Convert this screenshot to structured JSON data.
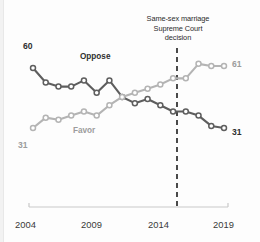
{
  "chart_data": {
    "type": "line",
    "title": "",
    "subtitle": "",
    "xlabel": "",
    "ylabel": "",
    "xlim": [
      2004,
      2019
    ],
    "ylim": [
      0,
      100
    ],
    "grid": false,
    "legend_position": "inline-labels",
    "x": [
      2004,
      2005,
      2006,
      2007,
      2008,
      2009,
      2010,
      2011,
      2012,
      2013,
      2014,
      2015,
      2016,
      2017,
      2018,
      2019
    ],
    "tick_labels": [
      "2004",
      "2009",
      "2014",
      "2019"
    ],
    "tick_values": [
      2004,
      2009,
      2014,
      2019
    ],
    "series": [
      {
        "name": "Oppose",
        "color": "#5e5e5e",
        "values": [
          60,
          53,
          51,
          51,
          54,
          48,
          54,
          46,
          43,
          45,
          42,
          39,
          39,
          37,
          32,
          31
        ],
        "start_label": "60",
        "end_label": "31"
      },
      {
        "name": "Favor",
        "color": "#b4b4b4",
        "values": [
          31,
          36,
          35,
          37,
          39,
          37,
          42,
          46,
          48,
          50,
          52,
          55,
          55,
          62,
          61,
          61
        ],
        "start_label": "31",
        "end_label": "61"
      }
    ],
    "annotations": [
      {
        "name": "supreme-court-decision",
        "lines": [
          "Same-sex marriage",
          "Supreme Court",
          "decision"
        ],
        "x": 2015.3,
        "style": "dashed-vertical-line",
        "color": "#2b2b2b"
      }
    ]
  },
  "annotation": {
    "line1": "Same-sex marriage",
    "line2": "Supreme Court",
    "line3": "decision"
  },
  "labels": {
    "oppose": "Oppose",
    "favor": "Favor",
    "oppose_start": "60",
    "oppose_end": "31",
    "favor_start": "31",
    "favor_end": "61"
  },
  "axis": {
    "ticks": [
      "2004",
      "2009",
      "2014",
      "2019"
    ]
  },
  "colors": {
    "oppose": "#5e5e5e",
    "favor": "#b4b4b4",
    "annotation": "#2b2b2b",
    "axis": "#c9c9c9",
    "background": "#fdfdfd"
  }
}
